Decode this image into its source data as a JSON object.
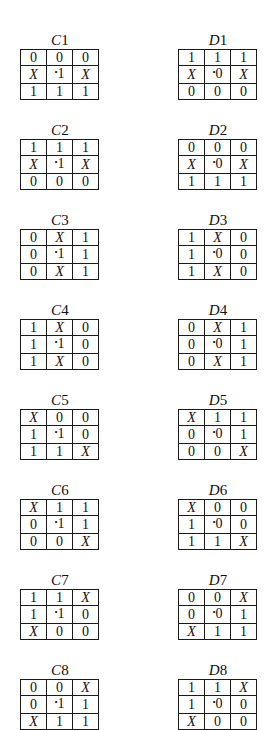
{
  "diagram": {
    "type": "grid-set",
    "columns": [
      "C",
      "D"
    ],
    "center_marker": "•",
    "blocks": {
      "C": [
        {
          "label": "C1",
          "rows": [
            [
              "0",
              "0",
              "0"
            ],
            [
              "X",
              "•1",
              "X"
            ],
            [
              "1",
              "1",
              "1"
            ]
          ]
        },
        {
          "label": "C2",
          "rows": [
            [
              "1",
              "1",
              "1"
            ],
            [
              "X",
              "•1",
              "X"
            ],
            [
              "0",
              "0",
              "0"
            ]
          ]
        },
        {
          "label": "C3",
          "rows": [
            [
              "0",
              "X",
              "1"
            ],
            [
              "0",
              "•1",
              "1"
            ],
            [
              "0",
              "X",
              "1"
            ]
          ]
        },
        {
          "label": "C4",
          "rows": [
            [
              "1",
              "X",
              "0"
            ],
            [
              "1",
              "•1",
              "0"
            ],
            [
              "1",
              "X",
              "0"
            ]
          ]
        },
        {
          "label": "C5",
          "rows": [
            [
              "X",
              "0",
              "0"
            ],
            [
              "1",
              "•1",
              "0"
            ],
            [
              "1",
              "1",
              "X"
            ]
          ]
        },
        {
          "label": "C6",
          "rows": [
            [
              "X",
              "1",
              "1"
            ],
            [
              "0",
              "•1",
              "1"
            ],
            [
              "0",
              "0",
              "X"
            ]
          ]
        },
        {
          "label": "C7",
          "rows": [
            [
              "1",
              "1",
              "X"
            ],
            [
              "1",
              "•1",
              "0"
            ],
            [
              "X",
              "0",
              "0"
            ]
          ]
        },
        {
          "label": "C8",
          "rows": [
            [
              "0",
              "0",
              "X"
            ],
            [
              "0",
              "•1",
              "1"
            ],
            [
              "X",
              "1",
              "1"
            ]
          ]
        }
      ],
      "D": [
        {
          "label": "D1",
          "rows": [
            [
              "1",
              "1",
              "1"
            ],
            [
              "X",
              "•0",
              "X"
            ],
            [
              "0",
              "0",
              "0"
            ]
          ]
        },
        {
          "label": "D2",
          "rows": [
            [
              "0",
              "0",
              "0"
            ],
            [
              "X",
              "•0",
              "X"
            ],
            [
              "1",
              "1",
              "1"
            ]
          ]
        },
        {
          "label": "D3",
          "rows": [
            [
              "1",
              "X",
              "0"
            ],
            [
              "1",
              "•0",
              "0"
            ],
            [
              "1",
              "X",
              "0"
            ]
          ]
        },
        {
          "label": "D4",
          "rows": [
            [
              "0",
              "X",
              "1"
            ],
            [
              "0",
              "•0",
              "1"
            ],
            [
              "0",
              "X",
              "1"
            ]
          ]
        },
        {
          "label": "D5",
          "rows": [
            [
              "X",
              "1",
              "1"
            ],
            [
              "0",
              "•0",
              "1"
            ],
            [
              "0",
              "0",
              "X"
            ]
          ]
        },
        {
          "label": "D6",
          "rows": [
            [
              "X",
              "0",
              "0"
            ],
            [
              "1",
              "•0",
              "0"
            ],
            [
              "1",
              "1",
              "X"
            ]
          ]
        },
        {
          "label": "D7",
          "rows": [
            [
              "0",
              "0",
              "X"
            ],
            [
              "0",
              "•0",
              "1"
            ],
            [
              "X",
              "1",
              "1"
            ]
          ]
        },
        {
          "label": "D8",
          "rows": [
            [
              "1",
              "1",
              "X"
            ],
            [
              "1",
              "•0",
              "0"
            ],
            [
              "X",
              "0",
              "0"
            ]
          ]
        }
      ]
    }
  },
  "layout": {
    "C_x": 20,
    "D_x": 178,
    "top_y": [
      33,
      123,
      213,
      303,
      393,
      483,
      573,
      663
    ]
  }
}
